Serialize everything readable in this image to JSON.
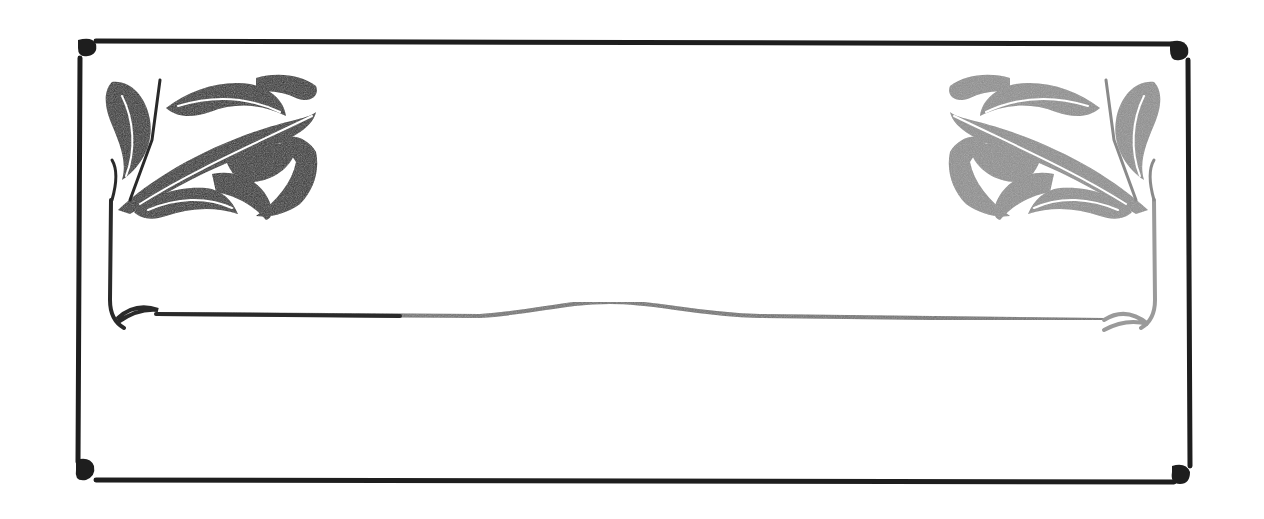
{
  "frame": {
    "style": "art-nouveau ornamental border",
    "stroke_color": "#1e1e1e",
    "ornament_left_color": "#2a2a2a",
    "ornament_right_color": "#8a8a8a",
    "background": "#ffffff"
  },
  "ornaments": [
    {
      "name": "oak-leaf-ornament-left",
      "position": "top-left"
    },
    {
      "name": "oak-leaf-ornament-right",
      "position": "top-right"
    }
  ],
  "panel": {
    "text": ""
  }
}
